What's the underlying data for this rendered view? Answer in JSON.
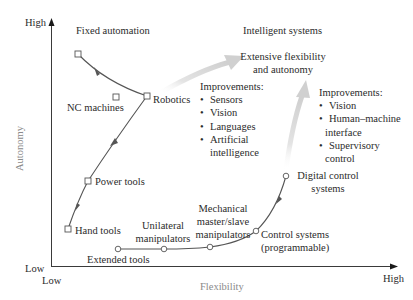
{
  "axes": {
    "y_label": "Autonomy",
    "x_label": "Flexibility",
    "y_high": "High",
    "y_low": "Low",
    "x_low": "Low",
    "x_high": "High"
  },
  "regions": {
    "fixed_automation": "Fixed automation",
    "intelligent_systems": "Intelligent systems",
    "goal_line1": "Extensive flexibility",
    "goal_line2": "and autonomy"
  },
  "autonomy_path": {
    "points": [
      {
        "label": "Hand tools"
      },
      {
        "label": "Power tools"
      },
      {
        "label": "NC machines"
      },
      {
        "label": "Robotics"
      }
    ]
  },
  "flexibility_path": {
    "points": [
      {
        "label": "Extended tools"
      },
      {
        "label_line1": "Unilateral",
        "label_line2": "manipulators"
      },
      {
        "label_line1": "Mechanical",
        "label_line2": "master/slave",
        "label_line3": "manipulators"
      },
      {
        "label_line1": "Control systems",
        "label_line2": "(programmable)"
      },
      {
        "label_line1": "Digital control",
        "label_line2": "systems"
      }
    ]
  },
  "improvements_left": {
    "heading": "Improvements:",
    "items": [
      "Sensors",
      "Vision",
      "Languages",
      "Artificial",
      "intelligence"
    ]
  },
  "improvements_right": {
    "heading": "Improvements:",
    "items": [
      "Vision",
      "Human–machine",
      "interface",
      "Supervisory",
      "control"
    ]
  },
  "colors": {
    "axis": "#3a3a3a",
    "curve": "#555555",
    "big_arrow": "#d4d4d4",
    "axis_label": "#8a8a8a"
  }
}
